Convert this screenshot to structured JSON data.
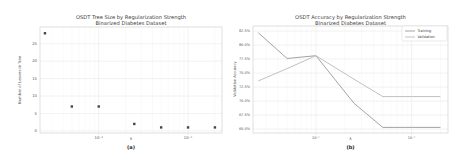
{
  "figure": {
    "colors": {
      "grid_major": "#e9e9e9",
      "grid_minor": "#f5f5f5",
      "spine": "#d2d2d2",
      "title_text": "#3d3d3d",
      "tick_text": "#555555",
      "caption_text": "#222222",
      "marker": "#454545",
      "training_line": "#999999",
      "validation_line": "#bababa",
      "legend_border": "#dcdcdc"
    },
    "panels": [
      {
        "title_line1": "OSDT Tree Size by Regularization Strength",
        "title_line2": "Binarized Diabetes Dataset",
        "ylabel": "Number of Leaves in Tree",
        "xlabel": "λ",
        "caption": "(a)"
      },
      {
        "title_line1": "OSDT Accuracy by Regularization Strength",
        "title_line2": "Binarized Diabetes Dataset",
        "ylabel": "Validation Accuracy",
        "xlabel": "λ",
        "caption": "(b)"
      }
    ]
  },
  "chart_data": [
    {
      "type": "scatter",
      "title": "OSDT Tree Size by Regularization Strength",
      "subtitle": "Binarized Diabetes Dataset",
      "xlabel": "λ",
      "ylabel": "Number of Leaves in Tree",
      "x_scale": "log",
      "x": [
        0.0025,
        0.005,
        0.01,
        0.025,
        0.05,
        0.1,
        0.2
      ],
      "y": [
        28,
        7,
        7,
        2,
        1,
        1,
        1
      ],
      "xlim": [
        0.0022,
        0.24
      ],
      "ylim": [
        -0.6,
        29.8
      ],
      "x_tick_values": [
        0.01,
        0.1
      ],
      "x_tick_labels": [
        "10⁻²",
        "10⁻¹"
      ],
      "y_tick_values": [
        0,
        5,
        10,
        15,
        20,
        25
      ],
      "y_tick_labels": [
        "0",
        "5",
        "10",
        "15",
        "20",
        "25"
      ],
      "grid": true,
      "caption": "(a)"
    },
    {
      "type": "line",
      "title": "OSDT Accuracy by Regularization Strength",
      "subtitle": "Binarized Diabetes Dataset",
      "xlabel": "λ",
      "ylabel": "Validation Accuracy",
      "x_scale": "log",
      "x": [
        0.0025,
        0.005,
        0.01,
        0.025,
        0.05,
        0.1,
        0.2
      ],
      "series": [
        {
          "name": "Training",
          "color": "#999999",
          "values": [
            82.2,
            77.6,
            78.1,
            69.6,
            65.3,
            65.3,
            65.3
          ]
        },
        {
          "name": "Validation",
          "color": "#bababa",
          "values": [
            73.6,
            75.8,
            78.1,
            73.9,
            70.8,
            70.8,
            70.8
          ]
        }
      ],
      "xlim": [
        0.0022,
        0.24
      ],
      "ylim": [
        64.3,
        83.4
      ],
      "x_tick_values": [
        0.01,
        0.1
      ],
      "x_tick_labels": [
        "10⁻²",
        "10⁻¹"
      ],
      "y_tick_values": [
        82.5,
        80.0,
        77.5,
        75.0,
        72.5,
        70.0,
        67.5,
        65.0
      ],
      "y_tick_labels": [
        "82.5%",
        "80.0%",
        "77.5%",
        "75.0%",
        "72.5%",
        "70.0%",
        "67.5%",
        "65.0%"
      ],
      "legend_position": "upper right",
      "legend_entries": [
        "Training",
        "Validation"
      ],
      "grid": true,
      "caption": "(b)"
    }
  ]
}
